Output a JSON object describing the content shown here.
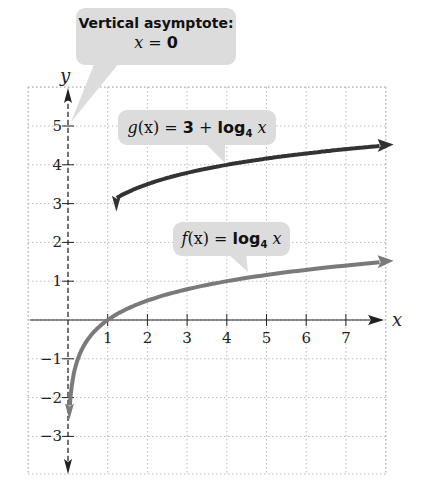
{
  "chart_data": {
    "type": "line",
    "title": "",
    "xlabel": "x",
    "ylabel": "y",
    "xlim": [
      -1,
      8
    ],
    "ylim": [
      -4,
      6
    ],
    "grid": true,
    "x_ticks": [
      1,
      2,
      3,
      4,
      5,
      6,
      7
    ],
    "y_ticks": [
      -3,
      -2,
      -1,
      1,
      2,
      3,
      4,
      5
    ],
    "x_tick_labels": [
      "1",
      "2",
      "3",
      "4",
      "5",
      "6",
      "7"
    ],
    "y_tick_labels": [
      "−3",
      "−2",
      "−1",
      "1",
      "2",
      "3",
      "4",
      "5"
    ],
    "series": [
      {
        "name": "g(x) = 3 + log4 x",
        "color": "#333333",
        "x": [
          0.0625,
          0.25,
          0.5,
          1,
          2,
          4,
          7.9
        ],
        "y": [
          1,
          2,
          2.5,
          3,
          3.5,
          4,
          4.49
        ]
      },
      {
        "name": "f(x) = log4 x",
        "color": "#7a7a7a",
        "x": [
          0.0625,
          0.25,
          0.5,
          1,
          2,
          4,
          7.9
        ],
        "y": [
          -2,
          -1,
          -0.5,
          0,
          0.5,
          1,
          1.49
        ]
      }
    ],
    "annotations": [
      {
        "text": "Vertical asymptote: x = 0",
        "points_to": [
          0,
          5.5
        ]
      },
      {
        "text": "g(x) = 3 + log4 x"
      },
      {
        "text": "f(x) = log4 x"
      }
    ]
  },
  "labels": {
    "asymptote_title": "Vertical asymptote:",
    "asymptote_eq_var": "x",
    "asymptote_eq_rest": " = ",
    "asymptote_eq_val": "0",
    "g_name": "g",
    "g_paren": "(x)",
    "g_eq": " = ",
    "g_three": "3",
    "g_plus": " + ",
    "g_log": "log",
    "g_base": "4",
    "g_var": " x",
    "f_name": "f",
    "f_paren": "(x)",
    "f_eq": " = ",
    "f_log": "log",
    "f_base": "4",
    "f_var": " x",
    "x_axis": "x",
    "y_axis": "y"
  }
}
